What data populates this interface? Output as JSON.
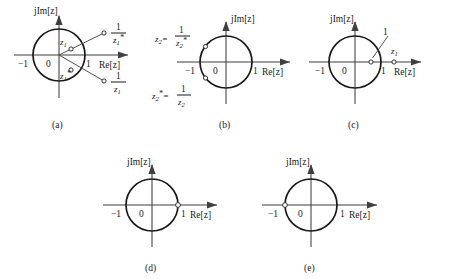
{
  "figure": {
    "axis_labels": {
      "imaginary": "jIm[z]",
      "real": "Re[z]",
      "origin": "0",
      "minus_one": "−1",
      "plus_one": "1"
    },
    "panels": [
      {
        "id": "a",
        "caption": "(a)",
        "points": [
          {
            "name": "z1",
            "label": "z₁",
            "position": "inside-upper-right",
            "on_circle": false
          },
          {
            "name": "z1-conj",
            "label": "z₁*",
            "position": "inside-lower-right",
            "on_circle": false
          },
          {
            "name": "recip-z1-conj",
            "label": "1/z₁*",
            "position": "outside-upper-right",
            "on_circle": false
          },
          {
            "name": "recip-z1",
            "label": "1/z₁",
            "position": "outside-lower-right",
            "on_circle": false
          }
        ],
        "fractions": [
          {
            "numerator": "1",
            "denominator": "z₁*"
          },
          {
            "numerator": "1",
            "denominator": "z₁"
          }
        ]
      },
      {
        "id": "b",
        "caption": "(b)",
        "points": [
          {
            "name": "z2",
            "label": "z₂ = 1/z₂*",
            "position": "on-circle-upper-left",
            "on_circle": true
          },
          {
            "name": "z2-conj",
            "label": "z₂* = 1/z₂",
            "position": "on-circle-lower-left",
            "on_circle": true
          }
        ],
        "equations": [
          {
            "lhs": "z₂=",
            "numerator": "1",
            "denominator": "z₂*"
          },
          {
            "lhs": "z₂*=",
            "numerator": "1",
            "denominator": "z₂"
          }
        ]
      },
      {
        "id": "c",
        "caption": "(c)",
        "points": [
          {
            "name": "recip-z1",
            "label": "1/z₁",
            "position": "inside-real-axis",
            "on_circle": false
          },
          {
            "name": "z1",
            "label": "z₁",
            "position": "outside-real-axis",
            "on_circle": false
          }
        ],
        "fractions": [
          {
            "numerator": "1",
            "denominator": "z₁"
          }
        ]
      },
      {
        "id": "d",
        "caption": "(d)",
        "points": [
          {
            "name": "point-at-one",
            "label": "",
            "position": "on-circle-at-plus-one",
            "on_circle": true
          }
        ]
      },
      {
        "id": "e",
        "caption": "(e)",
        "points": [
          {
            "name": "point-at-minus-one",
            "label": "",
            "position": "on-circle-at-minus-one",
            "on_circle": true
          }
        ]
      }
    ],
    "symbols": {
      "z": "z",
      "one": "1",
      "sub1": "1",
      "sub2": "2",
      "star": "*",
      "equals": "="
    }
  }
}
